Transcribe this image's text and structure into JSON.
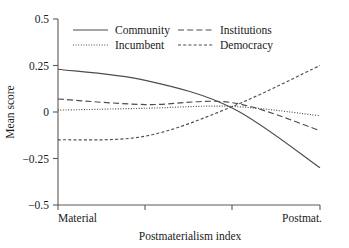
{
  "chart_data": {
    "type": "line",
    "title": "",
    "xlabel": "Postmaterialism index",
    "ylabel": "Mean score",
    "xlim": [
      0,
      3
    ],
    "ylim": [
      -0.5,
      0.5
    ],
    "grid": false,
    "legend_position": "top-inside",
    "x": [
      0,
      1,
      2,
      3
    ],
    "xtick_labels": [
      "Material",
      "",
      "",
      "Postmat."
    ],
    "ytick_labels": [
      "0.5",
      "0.25",
      "0",
      "−0.25",
      "−0.5"
    ],
    "ytick_values": [
      0.5,
      0.25,
      0,
      -0.25,
      -0.5
    ],
    "series": [
      {
        "name": "Community",
        "style": "solid",
        "values": [
          0.23,
          0.17,
          0.02,
          -0.3
        ]
      },
      {
        "name": "Incumbent",
        "style": "dotted",
        "values": [
          0.01,
          0.02,
          0.03,
          -0.02
        ]
      },
      {
        "name": "Institutions",
        "style": "long-dash",
        "values": [
          0.07,
          0.04,
          0.05,
          -0.1
        ]
      },
      {
        "name": "Democracy",
        "style": "short-dash",
        "values": [
          -0.15,
          -0.13,
          0.03,
          0.25
        ]
      }
    ]
  },
  "legend": {
    "entries": [
      {
        "label": "Community",
        "style": "solid"
      },
      {
        "label": "Institutions",
        "style": "long-dash"
      },
      {
        "label": "Incumbent",
        "style": "dotted"
      },
      {
        "label": "Democracy",
        "style": "short-dash"
      }
    ]
  },
  "axes": {
    "y_title": "Mean score",
    "x_title": "Postmaterialism index",
    "y_ticks": [
      "0.5",
      "0.25",
      "0",
      "−0.25",
      "−0.5"
    ],
    "x_ticks": [
      "Material",
      "Postmat."
    ]
  }
}
